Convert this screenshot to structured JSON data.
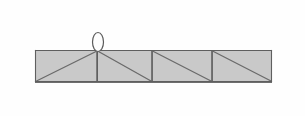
{
  "figure": {
    "name": "truss-beam-elevation",
    "background_color": "#fefefe",
    "canvas": {
      "width": 305,
      "height": 116
    }
  },
  "chart_data": {
    "type": "diagram",
    "title": "",
    "subtitle": "",
    "xlabel": "",
    "ylabel": "",
    "geometry": {
      "beam_left_x": 35,
      "beam_right_x": 272,
      "beam_top_y": 50,
      "beam_bottom_y": 82,
      "beam_width": 237,
      "beam_height": 32,
      "panel_divider_x": [
        97,
        152,
        212
      ],
      "panel_boundaries_x": [
        35,
        97,
        152,
        212,
        272
      ]
    },
    "panels": [
      {
        "index": 1,
        "name": "panel-1",
        "x_start": 35,
        "x_end": 97,
        "width": 62,
        "diagonal_direction": "bottom-left-to-top-right",
        "fill": "#c9c9c9"
      },
      {
        "index": 2,
        "name": "panel-2",
        "x_start": 97,
        "x_end": 152,
        "width": 55,
        "diagonal_direction": "top-left-to-bottom-right",
        "fill": "#c9c9c9"
      },
      {
        "index": 3,
        "name": "panel-3",
        "x_start": 152,
        "x_end": 212,
        "width": 60,
        "diagonal_direction": "top-left-to-bottom-right",
        "fill": "#c9c9c9"
      },
      {
        "index": 4,
        "name": "panel-4",
        "x_start": 212,
        "x_end": 272,
        "width": 60,
        "diagonal_direction": "top-left-to-bottom-right",
        "fill": "#c9c9c9"
      }
    ],
    "vertical_member": {
      "name": "vertical-web-member",
      "x": 97,
      "y_top": 50,
      "y_bottom": 82
    },
    "lifting_eye": {
      "name": "lifting-eye",
      "shape": "ellipse",
      "center_x": 98,
      "center_y": 42,
      "radius_x": 5.5,
      "radius_y": 9.5,
      "fill": "#fdfdfd",
      "stroke": "#5a5a5a"
    },
    "colors": {
      "panel_fill": "#c9c9c9",
      "outline": "#6e6e6e",
      "web_line": "#6a6a6a",
      "eye_fill": "#fdfdfd",
      "eye_stroke": "#5a5a5a",
      "background": "#fefefe"
    },
    "labels": [],
    "annotations": [],
    "legend": [],
    "grid": false
  }
}
